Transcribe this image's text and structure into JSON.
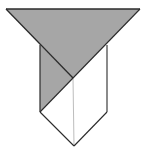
{
  "figure": {
    "description": "Folded paper / origami-style shape: gray inverted triangle on top overlapping a pentagonal shield with a vertical center crease",
    "colors": {
      "background": "#ffffff",
      "gray_fill": "#a6a6a6",
      "white_fill": "#ffffff",
      "outline": "#2b2b2b",
      "crease": "#bdbdbd"
    },
    "points": {
      "top_left": [
        6,
        9
      ],
      "top_right": [
        140,
        9
      ],
      "left_top": [
        40,
        45
      ],
      "right_top": [
        107,
        45
      ],
      "center": [
        73,
        78
      ],
      "left_bottom": [
        40,
        112
      ],
      "right_bottom": [
        107,
        112
      ],
      "bottom_tip": [
        74,
        146
      ]
    }
  }
}
